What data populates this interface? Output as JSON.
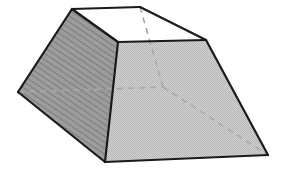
{
  "figure": {
    "name": "truncated-rectangular-pyramid",
    "canvas": {
      "width": 285,
      "height": 172,
      "background": "#ffffff"
    },
    "style": {
      "edge_color": "#1a1a1a",
      "edge_width": 2.2,
      "hidden_edge_color": "#a8a8a8",
      "hidden_edge_width": 1.6,
      "hidden_edge_dash": "6,5",
      "top_face_fill": "#ffffff",
      "left_face_fill": "#9c9c9c",
      "left_face_hatch_color": "#7c7c7c",
      "right_face_fill": "#c9c9c9",
      "right_face_stipple_color": "#b2b2b2"
    },
    "vertices": {
      "top_back_left": {
        "label": "A",
        "x": 72,
        "y": 9
      },
      "top_back_right": {
        "label": "B",
        "x": 140,
        "y": 7
      },
      "top_front_right": {
        "label": "C",
        "x": 206,
        "y": 40
      },
      "top_front_left": {
        "label": "D",
        "x": 118,
        "y": 42
      },
      "bottom_left": {
        "label": "E",
        "x": 18,
        "y": 92
      },
      "bottom_front_left": {
        "label": "F",
        "x": 105,
        "y": 162
      },
      "bottom_front_right": {
        "label": "G",
        "x": 268,
        "y": 155
      },
      "bottom_back_hidden": {
        "label": "H",
        "x": 163,
        "y": 87
      }
    },
    "faces": [
      {
        "name": "top-face",
        "points": "72,9 140,7 206,40 118,42",
        "fill": "#ffffff",
        "visible": true
      },
      {
        "name": "left-face",
        "points": "72,9 118,42 105,162 18,92",
        "fill": "#9c9c9c",
        "visible": true
      },
      {
        "name": "right-face",
        "points": "118,42 206,40 268,155 105,162",
        "fill": "#c9c9c9",
        "visible": true
      }
    ],
    "visible_edges": [
      {
        "name": "edge-top-back",
        "x1": 72,
        "y1": 9,
        "x2": 140,
        "y2": 7
      },
      {
        "name": "edge-top-right-back",
        "x1": 140,
        "y1": 7,
        "x2": 206,
        "y2": 40
      },
      {
        "name": "edge-top-front",
        "x1": 206,
        "y1": 40,
        "x2": 118,
        "y2": 42
      },
      {
        "name": "edge-top-left-front",
        "x1": 118,
        "y1": 42,
        "x2": 72,
        "y2": 9
      },
      {
        "name": "edge-lateral-left-back",
        "x1": 72,
        "y1": 9,
        "x2": 18,
        "y2": 92
      },
      {
        "name": "edge-lateral-ridge",
        "x1": 118,
        "y1": 42,
        "x2": 105,
        "y2": 162
      },
      {
        "name": "edge-lateral-right",
        "x1": 206,
        "y1": 40,
        "x2": 268,
        "y2": 155
      },
      {
        "name": "edge-bottom-left",
        "x1": 18,
        "y1": 92,
        "x2": 105,
        "y2": 162
      },
      {
        "name": "edge-bottom-front",
        "x1": 105,
        "y1": 162,
        "x2": 268,
        "y2": 155
      }
    ],
    "hidden_edges": [
      {
        "name": "hidden-edge-vertical-back",
        "x1": 140,
        "y1": 7,
        "x2": 163,
        "y2": 87
      },
      {
        "name": "hidden-edge-bottom-back-left",
        "x1": 18,
        "y1": 92,
        "x2": 163,
        "y2": 87
      },
      {
        "name": "hidden-edge-bottom-back-right",
        "x1": 163,
        "y1": 87,
        "x2": 268,
        "y2": 155
      }
    ]
  }
}
